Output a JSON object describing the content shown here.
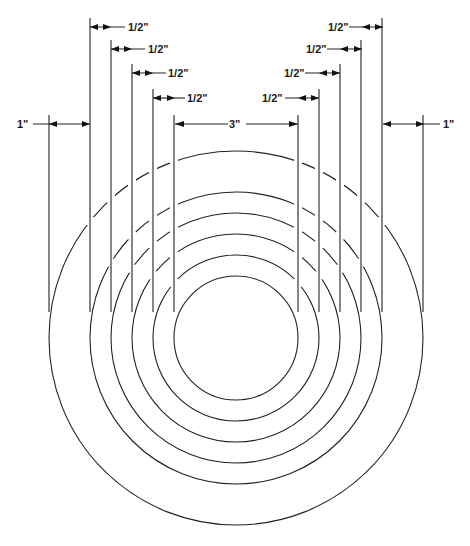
{
  "diagram": {
    "type": "concentric-rings-dimension-drawing",
    "center": {
      "x": 236,
      "y": 338
    },
    "rings": [
      {
        "name": "ring-1-inner",
        "radius": 62
      },
      {
        "name": "ring-2",
        "radius": 83
      },
      {
        "name": "ring-3",
        "radius": 104
      },
      {
        "name": "ring-4",
        "radius": 125
      },
      {
        "name": "ring-5",
        "radius": 146
      },
      {
        "name": "ring-6-outer",
        "radius": 187
      }
    ],
    "extension_lines_bottom_y": 312,
    "dimensions": {
      "center": {
        "label": "3\"",
        "y": 124
      },
      "left_half": [
        {
          "label": "1/2\"",
          "y": 27
        },
        {
          "label": "1/2\"",
          "y": 49
        },
        {
          "label": "1/2\"",
          "y": 73
        },
        {
          "label": "1/2\"",
          "y": 98
        }
      ],
      "right_half": [
        {
          "label": "1/2\"",
          "y": 27
        },
        {
          "label": "1/2\"",
          "y": 49
        },
        {
          "label": "1/2\"",
          "y": 73
        },
        {
          "label": "1/2\"",
          "y": 98
        }
      ],
      "left_outer": {
        "label": "1\"",
        "y": 124
      },
      "right_outer": {
        "label": "1\"",
        "y": 124
      }
    },
    "colors": {
      "line": "#222222",
      "background": "#ffffff"
    }
  }
}
